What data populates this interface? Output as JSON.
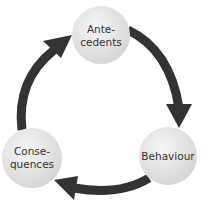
{
  "diagram": {
    "type": "cycle",
    "colors": {
      "arrow": "#333333",
      "node_fill_light": "#f4f4f4",
      "node_fill_dark": "#d6d6d6",
      "text": "#333333",
      "background": "#ffffff"
    },
    "nodes": [
      {
        "id": "antecedents",
        "lines": [
          "Ante-",
          "cedents"
        ],
        "cx": 101,
        "cy": 35,
        "r": 29
      },
      {
        "id": "behaviour",
        "lines": [
          "Behaviour"
        ],
        "cx": 168,
        "cy": 156,
        "r": 29
      },
      {
        "id": "consequences",
        "lines": [
          "Conse-",
          "quences"
        ],
        "cx": 32,
        "cy": 158,
        "r": 30
      }
    ],
    "edges": [
      {
        "from": "antecedents",
        "to": "behaviour",
        "direction": "clockwise"
      },
      {
        "from": "behaviour",
        "to": "consequences",
        "direction": "clockwise"
      },
      {
        "from": "consequences",
        "to": "antecedents",
        "direction": "clockwise"
      }
    ]
  }
}
